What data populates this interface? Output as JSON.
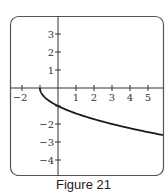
{
  "caption": "Figure 21",
  "chart_data": {
    "type": "line",
    "title": "",
    "xlabel": "",
    "ylabel": "",
    "xlim": [
      -2.6,
      5.85
    ],
    "ylim": [
      -4.6,
      4.0
    ],
    "grid": false,
    "legend": null,
    "x_ticks": [
      -2,
      -1,
      1,
      2,
      3,
      4,
      5
    ],
    "x_tick_labels": [
      "−2",
      "",
      "1",
      "2",
      "3",
      "4",
      "5"
    ],
    "y_ticks": [
      3,
      2,
      1,
      -1,
      -2,
      -3,
      -4
    ],
    "y_tick_labels": [
      "3",
      "2",
      "1",
      "",
      "−2",
      "−3",
      "−4"
    ],
    "series": [
      {
        "name": "y = -sqrt(x+1)",
        "x": [
          -1,
          -0.9,
          -0.75,
          -0.5,
          0,
          0.5,
          1,
          1.5,
          2,
          2.5,
          3,
          3.5,
          4,
          4.5,
          5,
          5.5,
          5.83
        ],
        "y": [
          0,
          -0.32,
          -0.5,
          -0.71,
          -1.0,
          -1.22,
          -1.41,
          -1.58,
          -1.73,
          -1.87,
          -2.0,
          -2.12,
          -2.24,
          -2.35,
          -2.45,
          -2.55,
          -2.61
        ],
        "color": "#1a1a1a"
      }
    ]
  },
  "colors": {
    "frame": "#555555",
    "axis": "#333333",
    "curve": "#1a1a1a"
  }
}
